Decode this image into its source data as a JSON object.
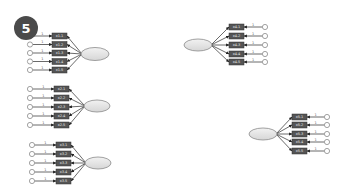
{
  "badge": {
    "label": "5",
    "cx": 26,
    "cy": 28,
    "r": 12,
    "color": "#4a4a4a"
  },
  "colors": {
    "box_fill": "#555555",
    "box_stroke": "#333333",
    "ellipse_fill_top": "#f2f2f2",
    "ellipse_fill_bottom": "#d6d6d6",
    "ellipse_stroke": "#8a8a8a",
    "circle_stroke": "#8a8a8a",
    "line": "#444444"
  },
  "groups": [
    {
      "name": "factor-1",
      "direction": "left",
      "ellipse": {
        "cx": 95,
        "cy": 54,
        "rx": 14,
        "ry": 6.5
      },
      "box_x": 52,
      "box_w": 15,
      "box_h": 6,
      "circle_x": 30,
      "rows": [
        36,
        44.5,
        53,
        61.5,
        70
      ],
      "weight": "1",
      "labels": [
        "x1.1",
        "x1.2",
        "x1.3",
        "x1.4",
        "x1.5"
      ]
    },
    {
      "name": "factor-2",
      "direction": "left",
      "ellipse": {
        "cx": 97,
        "cy": 106,
        "rx": 13,
        "ry": 6
      },
      "box_x": 54,
      "box_w": 15,
      "box_h": 6,
      "circle_x": 30,
      "rows": [
        89,
        98,
        107,
        116,
        125
      ],
      "weight": "1",
      "labels": [
        "x2.1",
        "x2.2",
        "x2.3",
        "x2.4",
        "x2.5"
      ]
    },
    {
      "name": "factor-3",
      "direction": "left",
      "ellipse": {
        "cx": 98,
        "cy": 163,
        "rx": 13,
        "ry": 6
      },
      "box_x": 56,
      "box_w": 15,
      "box_h": 6,
      "circle_x": 32,
      "rows": [
        145,
        154,
        163,
        172,
        181
      ],
      "weight": "1",
      "labels": [
        "x3.1",
        "x3.2",
        "x3.3",
        "x3.4",
        "x3.5"
      ]
    },
    {
      "name": "factor-4",
      "direction": "right",
      "ellipse": {
        "cx": 198,
        "cy": 45,
        "rx": 14,
        "ry": 6
      },
      "box_x": 229,
      "box_w": 15,
      "box_h": 6,
      "circle_x": 265,
      "rows": [
        27,
        36,
        45,
        54,
        62
      ],
      "weight": "1",
      "labels": [
        "x4.1",
        "x4.2",
        "x4.3",
        "x4.4",
        "x4.5"
      ]
    },
    {
      "name": "factor-5",
      "direction": "right",
      "ellipse": {
        "cx": 263,
        "cy": 134,
        "rx": 14,
        "ry": 6
      },
      "box_x": 292,
      "box_w": 15,
      "box_h": 6,
      "circle_x": 327,
      "rows": [
        117,
        125,
        134,
        142,
        151
      ],
      "weight": "1",
      "labels": [
        "x5.1",
        "x5.2",
        "x5.3",
        "x5.4",
        "x5.5"
      ]
    }
  ]
}
